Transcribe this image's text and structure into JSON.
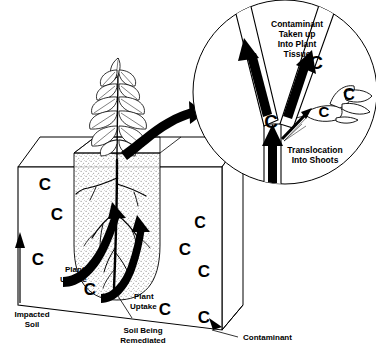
{
  "diagram": {
    "background_color": "#ffffff",
    "ink_color": "#000000",
    "soil_fill": "#f2f0ec"
  },
  "labels": {
    "impacted_soil": "Impacted\nSoil",
    "impacted_soil_line1": "Impacted",
    "impacted_soil_line2": "Soil",
    "plant_uptake_left_line1": "Plant",
    "plant_uptake_left_line2": "Uptake",
    "plant_uptake_right_line1": "Plant",
    "plant_uptake_right_line2": "Uptake",
    "soil_being_remediated_line1": "Soil Being",
    "soil_being_remediated_line2": "Remediated",
    "contaminant": "Contaminant",
    "contaminant_taken_up_line1": "Contaminant",
    "contaminant_taken_up_line2": "Taken up",
    "contaminant_taken_up_line3": "Into Plant",
    "contaminant_taken_up_line4": "Tissue",
    "translocation_line1": "Translocation",
    "translocation_line2": "Into Shoots"
  },
  "contaminant_marker": {
    "glyph": "C",
    "meaning": "contaminant molecule"
  },
  "contaminant_markers_soil": [
    {
      "id": "c-soil-1",
      "x": 45,
      "y": 190
    },
    {
      "id": "c-soil-2",
      "x": 57,
      "y": 220
    },
    {
      "id": "c-soil-3",
      "x": 38,
      "y": 265
    },
    {
      "id": "c-soil-4",
      "x": 90,
      "y": 295
    },
    {
      "id": "c-soil-5",
      "x": 165,
      "y": 315
    },
    {
      "id": "c-soil-6",
      "x": 200,
      "y": 228
    },
    {
      "id": "c-soil-7",
      "x": 185,
      "y": 255
    },
    {
      "id": "c-soil-8",
      "x": 204,
      "y": 277
    },
    {
      "id": "c-soil-9",
      "x": 204,
      "y": 323
    }
  ],
  "contaminant_markers_circle": [
    {
      "id": "c-stem-fork",
      "x": 271,
      "y": 121
    },
    {
      "id": "c-branch-tip",
      "x": 316,
      "y": 63
    },
    {
      "id": "c-shoot-near",
      "x": 324,
      "y": 111
    },
    {
      "id": "c-shoot-far",
      "x": 349,
      "y": 94
    }
  ]
}
